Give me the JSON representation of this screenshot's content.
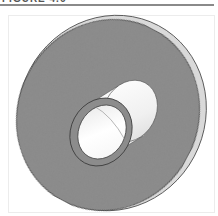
{
  "figure": {
    "caption": "FIGURE 4.6",
    "colors": {
      "flange_face": "#8c8c8c",
      "flange_edge": "#d8d8d8",
      "hub_outer": "#f2f2f2",
      "hub_bore": "#fafafa",
      "hub_rim": "#9a9a9a",
      "outline": "#3a3a3a",
      "rule": "#8a8a8a"
    }
  }
}
